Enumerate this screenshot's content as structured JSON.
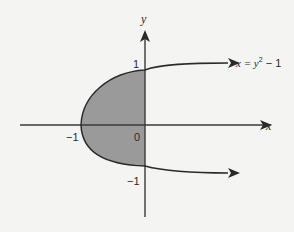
{
  "diagram": {
    "type": "graph-region",
    "curve_equation": "x = y² − 1",
    "curve_label_prefix": "x = y",
    "curve_label_exp": "2",
    "curve_label_suffix": " − 1",
    "axes": {
      "x_label": "x",
      "y_label": "y"
    },
    "ticks": {
      "x_neg_one": "−1",
      "origin": "0",
      "y_one": "1",
      "y_neg_one": "−1"
    },
    "shaded_region": "area bounded by x = y² − 1 and the y-axis, for −1 ≤ y ≤ 1",
    "colors": {
      "background": "#f4f4f2",
      "axis": "#3a3a3a",
      "curve": "#2a2a2a",
      "shading": "#9a9a9a"
    }
  }
}
